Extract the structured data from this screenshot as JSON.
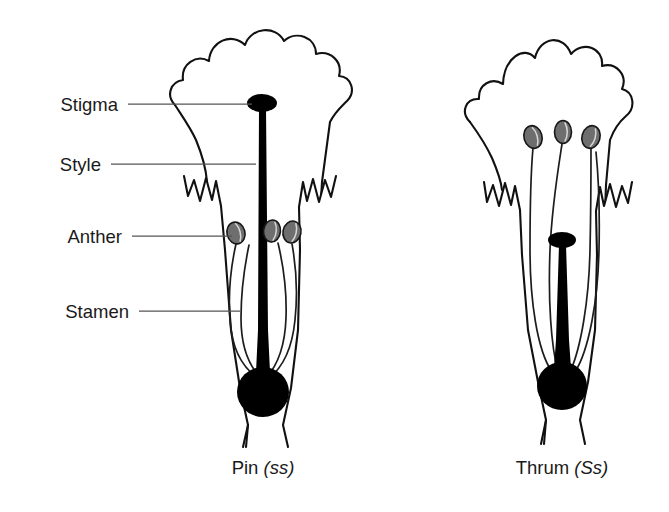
{
  "figure": {
    "background_color": "#ffffff",
    "ink_color": "#111111",
    "anther_color": "#6e6e6e",
    "pistil_color": "#000000",
    "leader_color": "#555555"
  },
  "labels": [
    {
      "id": "stigma",
      "text": "Stigma",
      "x": 118,
      "y": 111,
      "leader_from_x": 128,
      "leader_from_y": 104,
      "leader_to_x": 252,
      "leader_to_y": 104
    },
    {
      "id": "style",
      "text": "Style",
      "x": 101,
      "y": 171,
      "leader_from_x": 111,
      "leader_from_y": 164,
      "leader_to_x": 256,
      "leader_to_y": 164
    },
    {
      "id": "anther",
      "text": "Anther",
      "x": 122,
      "y": 243,
      "leader_from_x": 132,
      "leader_from_y": 236,
      "leader_to_x": 232,
      "leader_to_y": 236
    },
    {
      "id": "stamen",
      "text": "Stamen",
      "x": 129,
      "y": 318,
      "leader_from_x": 139,
      "leader_from_y": 311,
      "leader_to_x": 240,
      "leader_to_y": 311
    }
  ],
  "flowers": [
    {
      "id": "pin",
      "caption_name": "Pin",
      "caption_genotype": "(ss)",
      "caption_x": 263,
      "caption_y": 474,
      "style_length": "long",
      "stigma_position": "high-in-corolla-throat",
      "anther_position": "low-in-corolla-tube",
      "stigma": {
        "x": 262,
        "y": 103,
        "rx": 15,
        "ry": 9
      },
      "ovary": {
        "x": 263,
        "y": 392,
        "rx": 26,
        "ry": 25
      },
      "anthers": [
        {
          "x": 236,
          "y": 233,
          "rx": 9,
          "ry": 11,
          "rotate": -14
        },
        {
          "x": 272,
          "y": 231,
          "rx": 8.5,
          "ry": 11,
          "rotate": 6
        },
        {
          "x": 292,
          "y": 232,
          "rx": 9,
          "ry": 11,
          "rotate": 12
        }
      ]
    },
    {
      "id": "thrum",
      "caption_name": "Thrum",
      "caption_genotype": "(Ss)",
      "caption_x": 562,
      "caption_y": 474,
      "style_length": "short",
      "stigma_position": "low-in-corolla-tube",
      "anther_position": "high-in-corolla-throat",
      "stigma": {
        "x": 562,
        "y": 240,
        "rx": 14,
        "ry": 8
      },
      "ovary": {
        "x": 562,
        "y": 386,
        "rx": 25,
        "ry": 24
      },
      "anthers": [
        {
          "x": 533,
          "y": 137,
          "rx": 9,
          "ry": 11.5,
          "rotate": -16
        },
        {
          "x": 563,
          "y": 132,
          "rx": 8.5,
          "ry": 11.5,
          "rotate": 0
        },
        {
          "x": 591,
          "y": 137,
          "rx": 9,
          "ry": 11.5,
          "rotate": 16
        }
      ]
    }
  ]
}
